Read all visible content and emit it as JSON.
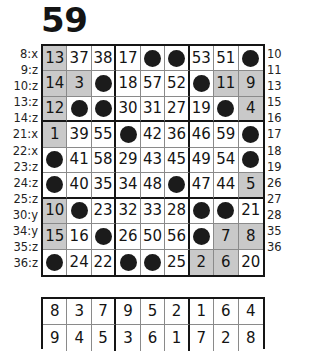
{
  "title": "59",
  "left_labels": [
    "8:x",
    "9:z",
    "10:z",
    "13:z",
    "14:z",
    "21:x",
    "22:x",
    "23:z",
    "24:z",
    "25:z",
    "30:y",
    "34:y",
    "35:z",
    "36:z"
  ],
  "right_labels": [
    "10",
    "11",
    "13",
    "15",
    "16",
    "17",
    "18",
    "19",
    "26",
    "27",
    "28",
    "35",
    "36"
  ],
  "main_grid": {
    "rows": 9,
    "cols": 9,
    "block_rows": 3,
    "block_cols": 3,
    "filled_marker": "dot",
    "shade_color": "#c9c9c9",
    "cells": [
      [
        {
          "v": "13",
          "s": true
        },
        {
          "v": "37",
          "s": false
        },
        {
          "v": "38",
          "s": false
        },
        {
          "v": "17",
          "s": false
        },
        {
          "v": "",
          "s": false
        },
        {
          "v": "",
          "s": false
        },
        {
          "v": "53",
          "s": false
        },
        {
          "v": "51",
          "s": false
        },
        {
          "v": "",
          "s": false
        }
      ],
      [
        {
          "v": "14",
          "s": true
        },
        {
          "v": "3",
          "s": true
        },
        {
          "v": "",
          "s": false
        },
        {
          "v": "18",
          "s": false
        },
        {
          "v": "57",
          "s": false
        },
        {
          "v": "52",
          "s": false
        },
        {
          "v": "",
          "s": false
        },
        {
          "v": "11",
          "s": true
        },
        {
          "v": "9",
          "s": true
        }
      ],
      [
        {
          "v": "12",
          "s": true
        },
        {
          "v": "",
          "s": false
        },
        {
          "v": "",
          "s": false
        },
        {
          "v": "30",
          "s": false
        },
        {
          "v": "31",
          "s": false
        },
        {
          "v": "27",
          "s": false
        },
        {
          "v": "19",
          "s": false
        },
        {
          "v": "",
          "s": false
        },
        {
          "v": "4",
          "s": true
        }
      ],
      [
        {
          "v": "1",
          "s": true
        },
        {
          "v": "39",
          "s": false
        },
        {
          "v": "55",
          "s": false
        },
        {
          "v": "",
          "s": false
        },
        {
          "v": "42",
          "s": false
        },
        {
          "v": "36",
          "s": false
        },
        {
          "v": "46",
          "s": false
        },
        {
          "v": "59",
          "s": false
        },
        {
          "v": "",
          "s": false
        }
      ],
      [
        {
          "v": "",
          "s": false
        },
        {
          "v": "41",
          "s": false
        },
        {
          "v": "58",
          "s": false
        },
        {
          "v": "29",
          "s": false
        },
        {
          "v": "43",
          "s": false
        },
        {
          "v": "45",
          "s": false
        },
        {
          "v": "49",
          "s": false
        },
        {
          "v": "54",
          "s": false
        },
        {
          "v": "",
          "s": false
        }
      ],
      [
        {
          "v": "",
          "s": false
        },
        {
          "v": "40",
          "s": false
        },
        {
          "v": "35",
          "s": false
        },
        {
          "v": "34",
          "s": false
        },
        {
          "v": "48",
          "s": false
        },
        {
          "v": "",
          "s": false
        },
        {
          "v": "47",
          "s": false
        },
        {
          "v": "44",
          "s": false
        },
        {
          "v": "5",
          "s": true
        }
      ],
      [
        {
          "v": "10",
          "s": true
        },
        {
          "v": "",
          "s": false
        },
        {
          "v": "23",
          "s": false
        },
        {
          "v": "32",
          "s": false
        },
        {
          "v": "33",
          "s": false
        },
        {
          "v": "28",
          "s": false
        },
        {
          "v": "",
          "s": false
        },
        {
          "v": "",
          "s": false
        },
        {
          "v": "21",
          "s": false
        }
      ],
      [
        {
          "v": "15",
          "s": true
        },
        {
          "v": "16",
          "s": false
        },
        {
          "v": "",
          "s": false
        },
        {
          "v": "26",
          "s": false
        },
        {
          "v": "50",
          "s": false
        },
        {
          "v": "56",
          "s": false
        },
        {
          "v": "",
          "s": false
        },
        {
          "v": "7",
          "s": true
        },
        {
          "v": "8",
          "s": true
        }
      ],
      [
        {
          "v": "",
          "s": false
        },
        {
          "v": "24",
          "s": false
        },
        {
          "v": "22",
          "s": false
        },
        {
          "v": "",
          "s": false
        },
        {
          "v": "",
          "s": false
        },
        {
          "v": "25",
          "s": false
        },
        {
          "v": "2",
          "s": true
        },
        {
          "v": "6",
          "s": true
        },
        {
          "v": "20",
          "s": false
        }
      ]
    ]
  },
  "bottom_grid": {
    "rows": 2,
    "cols": 9,
    "block_cols": 3,
    "cells": [
      [
        {
          "v": "8",
          "s": false
        },
        {
          "v": "3",
          "s": false
        },
        {
          "v": "7",
          "s": false
        },
        {
          "v": "9",
          "s": false
        },
        {
          "v": "5",
          "s": false
        },
        {
          "v": "2",
          "s": false
        },
        {
          "v": "1",
          "s": false
        },
        {
          "v": "6",
          "s": false
        },
        {
          "v": "4",
          "s": false
        }
      ],
      [
        {
          "v": "9",
          "s": false
        },
        {
          "v": "4",
          "s": false
        },
        {
          "v": "5",
          "s": false
        },
        {
          "v": "3",
          "s": false
        },
        {
          "v": "6",
          "s": false
        },
        {
          "v": "1",
          "s": false
        },
        {
          "v": "7",
          "s": false
        },
        {
          "v": "2",
          "s": false
        },
        {
          "v": "8",
          "s": false
        }
      ]
    ]
  }
}
